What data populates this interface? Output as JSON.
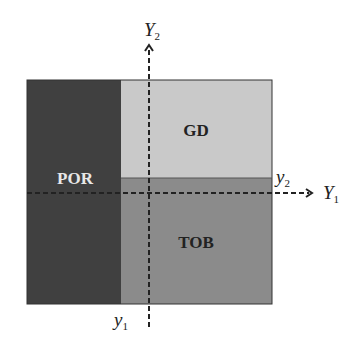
{
  "diagram": {
    "regions": [
      {
        "id": "por",
        "label": "POR",
        "color": "#404040",
        "text_color": "#e8e8e8"
      },
      {
        "id": "gd",
        "label": "GD",
        "color": "#c9c9c9",
        "text_color": "#222222"
      },
      {
        "id": "tob",
        "label": "TOB",
        "color": "#8b8b8b",
        "text_color": "#222222"
      }
    ],
    "axes": {
      "horizontal": {
        "name": "Y",
        "sub": "1"
      },
      "vertical": {
        "name": "Y",
        "sub": "2"
      }
    },
    "thresholds": {
      "y1": {
        "name": "y",
        "sub": "1"
      },
      "y2": {
        "name": "y",
        "sub": "2"
      }
    }
  }
}
